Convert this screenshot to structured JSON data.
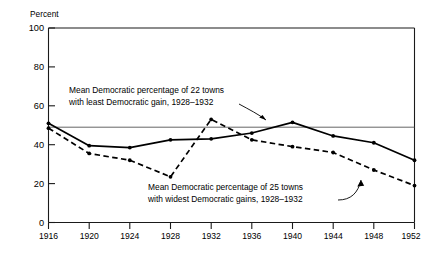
{
  "chart_data": {
    "type": "line",
    "title": "",
    "subtitle": "",
    "xlabel": "",
    "ylabel": "Percent",
    "ylim": [
      0,
      100
    ],
    "xlim": [
      1916,
      1952
    ],
    "yticks": [
      0,
      20,
      40,
      60,
      80,
      100
    ],
    "ytick_labels": [
      "0",
      "20",
      "40",
      "60",
      "80",
      "100"
    ],
    "x": [
      1916,
      1920,
      1924,
      1928,
      1932,
      1936,
      1940,
      1944,
      1948,
      1952
    ],
    "xtick_labels": [
      "1916",
      "1920",
      "1924",
      "1928",
      "1932",
      "1936",
      "1940",
      "1944",
      "1948",
      "1952"
    ],
    "grid": false,
    "legend_position": "annotations-inline",
    "reference_line": {
      "orientation": "horizontal",
      "value": 49,
      "label": ""
    },
    "series": [
      {
        "name": "Mean Democratic percentage of 22 towns with least Democratic gain, 1928–1932",
        "style": "solid",
        "values": [
          51,
          39.5,
          38.5,
          42.5,
          43,
          46,
          51.5,
          44.5,
          41,
          32
        ]
      },
      {
        "name": "Mean Democratic percentage of 25 towns with widest Democratic gains, 1928–1932",
        "style": "dashed",
        "values": [
          48.5,
          35.5,
          32,
          23.5,
          53,
          42.5,
          39,
          36,
          27,
          19
        ]
      }
    ],
    "annotations": [
      {
        "id": "anno-least-gain",
        "lines": [
          "Mean Democratic percentage of 22 towns",
          "with least Democratic gain, 1928–1932"
        ],
        "points_to": "series-solid"
      },
      {
        "id": "anno-widest-gains",
        "lines": [
          "Mean Democratic percentage of 25 towns",
          "with widest Democratic gains, 1928–1932"
        ],
        "points_to": "series-dashed"
      }
    ],
    "colors": {
      "series_line": "#000000",
      "axis": "#1a1a1a",
      "reference_line": "#555555",
      "background": "#ffffff"
    }
  }
}
